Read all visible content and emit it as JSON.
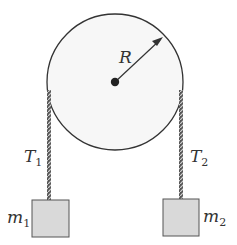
{
  "diagram": {
    "pulley": {
      "label": "R",
      "cx": 115,
      "cy": 82,
      "r": 68,
      "fill": "#f7f7f7",
      "stroke": "#333333"
    },
    "ropes": [
      {
        "name": "left",
        "tension_label": "T",
        "tension_sub": "1",
        "x": 49,
        "y1": 88,
        "y2": 200
      },
      {
        "name": "right",
        "tension_label": "T",
        "tension_sub": "2",
        "x": 181,
        "y1": 88,
        "y2": 199
      }
    ],
    "masses": [
      {
        "name": "m1",
        "label": "m",
        "sub": "1",
        "x": 32,
        "y": 200,
        "w": 37,
        "h": 37
      },
      {
        "name": "m2",
        "label": "m",
        "sub": "2",
        "x": 163,
        "y": 199,
        "w": 36,
        "h": 37
      }
    ],
    "colors": {
      "line": "#333333",
      "box_fill": "#d9d9d9",
      "rope_light": "#bfbfbf"
    }
  }
}
